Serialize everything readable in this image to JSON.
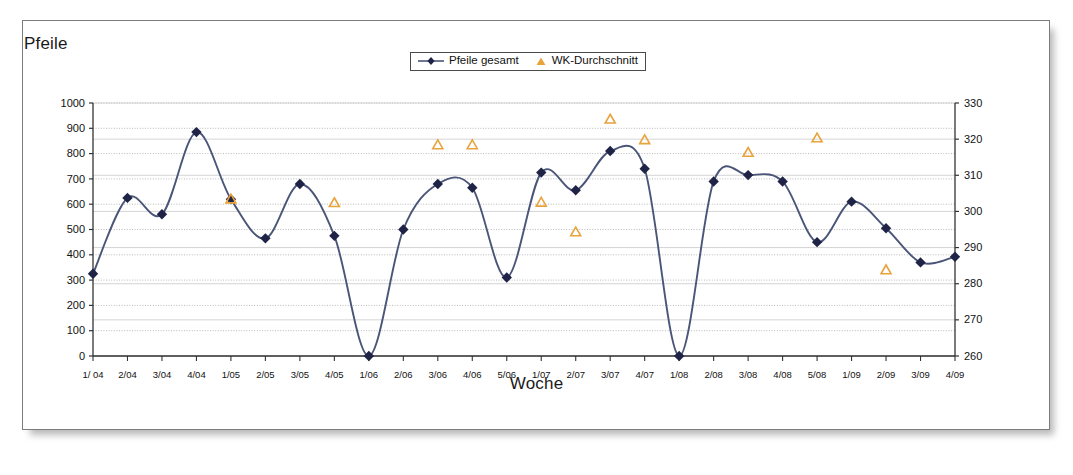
{
  "titles": {
    "y_axis_title": "Pfeile",
    "x_axis_title": "Woche"
  },
  "legend": {
    "series1_label": "Pfeile gesamt",
    "series2_label": "WK-Durchschnitt"
  },
  "colors": {
    "line": "#4a5578",
    "marker": "#1f2346",
    "triangle": "#e8a33d",
    "gridline": "#b9b9b9",
    "axis": "#333333",
    "frame": "#7c7c7c"
  },
  "chart_data": {
    "type": "line",
    "title": "",
    "xlabel": "Woche",
    "ylabel": "Pfeile",
    "grid": true,
    "legend_position": "top-center",
    "categories": [
      "1/ 04",
      "2/04",
      "3/04",
      "4/04",
      "1/05",
      "2/05",
      "3/05",
      "4/05",
      "1/06",
      "2/06",
      "3/06",
      "4/06",
      "5/06",
      "1/07",
      "2/07",
      "3/07",
      "4/07",
      "1/08",
      "2/08",
      "3/08",
      "4/08",
      "5/08",
      "1/09",
      "2/09",
      "3/09",
      "4/09"
    ],
    "y_left": {
      "label": "Pfeile",
      "ylim": [
        0,
        1000
      ],
      "ticks": [
        0,
        100,
        200,
        300,
        400,
        500,
        600,
        700,
        800,
        900,
        1000
      ]
    },
    "y_right": {
      "label": "",
      "ylim": [
        260,
        330
      ],
      "ticks": [
        260,
        270,
        280,
        290,
        300,
        310,
        320,
        330
      ]
    },
    "series": [
      {
        "name": "Pfeile gesamt",
        "axis": "left",
        "marker": "diamond",
        "color": "#1f2346",
        "values": [
          325,
          625,
          560,
          885,
          620,
          465,
          680,
          475,
          0,
          500,
          680,
          665,
          310,
          725,
          655,
          810,
          740,
          0,
          690,
          715,
          690,
          450,
          610,
          505,
          370,
          392
        ]
      },
      {
        "name": "WK-Durchschnitt",
        "axis": "right",
        "marker": "triangle",
        "color": "#e8a33d",
        "values": [
          null,
          null,
          null,
          null,
          303.4,
          null,
          null,
          302.4,
          null,
          null,
          318.4,
          318.4,
          null,
          302.5,
          294.3,
          325.5,
          319.8,
          null,
          null,
          316.3,
          null,
          320.3,
          null,
          283.8,
          null,
          null
        ]
      }
    ]
  }
}
